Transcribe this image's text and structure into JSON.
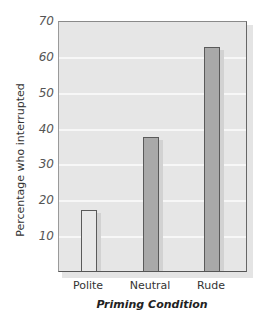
{
  "chart_data": {
    "type": "bar",
    "title": "",
    "xlabel": "Priming Condition",
    "ylabel": "Percentage who interrupted",
    "categories": [
      "Polite",
      "Neutral",
      "Rude"
    ],
    "values": [
      17,
      37.5,
      62.5
    ],
    "ylim": [
      0,
      70
    ],
    "yticks": [
      10,
      20,
      30,
      40,
      50,
      60,
      70
    ],
    "grid": true,
    "legend": null,
    "bar_colors": [
      "#e8e8e8",
      "#a9a9a9",
      "#a9a9a9"
    ]
  },
  "labels": {
    "xlabel": "Priming Condition",
    "ylabel": "Percentage who interrupted",
    "yticks": [
      "10",
      "20",
      "30",
      "40",
      "50",
      "60",
      "70"
    ],
    "xticks": [
      "Polite",
      "Neutral",
      "Rude"
    ]
  }
}
